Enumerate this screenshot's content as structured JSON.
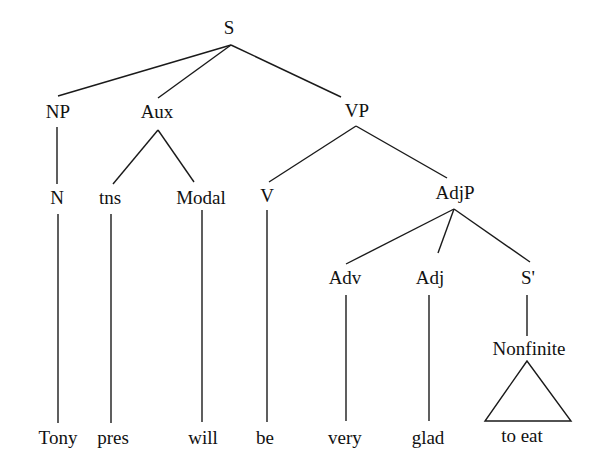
{
  "diagram": {
    "type": "syntax-tree",
    "colors": {
      "line": "#1a1a1a",
      "text": "#111111",
      "background": "#ffffff"
    },
    "nodes": [
      {
        "id": "S",
        "label": "S",
        "x": 229,
        "y": 30
      },
      {
        "id": "NP",
        "label": "NP",
        "x": 58,
        "y": 114
      },
      {
        "id": "Aux",
        "label": "Aux",
        "x": 157,
        "y": 114
      },
      {
        "id": "VP",
        "label": "VP",
        "x": 357,
        "y": 113
      },
      {
        "id": "N",
        "label": "N",
        "x": 57,
        "y": 200
      },
      {
        "id": "tns",
        "label": "tns",
        "x": 110,
        "y": 200
      },
      {
        "id": "Modal",
        "label": "Modal",
        "x": 201,
        "y": 200
      },
      {
        "id": "V",
        "label": "V",
        "x": 267,
        "y": 198
      },
      {
        "id": "AdjP",
        "label": "AdjP",
        "x": 455,
        "y": 195
      },
      {
        "id": "Adv",
        "label": "Adv",
        "x": 345,
        "y": 280
      },
      {
        "id": "Adj",
        "label": "Adj",
        "x": 430,
        "y": 280
      },
      {
        "id": "Sbar",
        "label": "S'",
        "x": 528,
        "y": 280
      },
      {
        "id": "Nonfinite",
        "label": "Nonfinite",
        "x": 529,
        "y": 351
      }
    ],
    "leaves": [
      {
        "id": "tony",
        "label": "Tony",
        "x": 58,
        "y": 440
      },
      {
        "id": "pres",
        "label": "pres",
        "x": 113,
        "y": 440
      },
      {
        "id": "will",
        "label": "will",
        "x": 203,
        "y": 440
      },
      {
        "id": "be",
        "label": "be",
        "x": 265,
        "y": 440
      },
      {
        "id": "very",
        "label": "very",
        "x": 345,
        "y": 440
      },
      {
        "id": "glad",
        "label": "glad",
        "x": 428,
        "y": 440
      },
      {
        "id": "to-eat",
        "label": "to eat",
        "x": 522,
        "y": 438
      }
    ],
    "edges": [
      {
        "from": "S",
        "to": "NP"
      },
      {
        "from": "S",
        "to": "Aux"
      },
      {
        "from": "S",
        "to": "VP"
      },
      {
        "from": "NP",
        "to": "N"
      },
      {
        "from": "Aux",
        "to": "tns"
      },
      {
        "from": "Aux",
        "to": "Modal"
      },
      {
        "from": "VP",
        "to": "V"
      },
      {
        "from": "VP",
        "to": "AdjP"
      },
      {
        "from": "AdjP",
        "to": "Adv"
      },
      {
        "from": "AdjP",
        "to": "Adj"
      },
      {
        "from": "AdjP",
        "to": "Sbar"
      },
      {
        "from": "Sbar",
        "to": "Nonfinite"
      },
      {
        "from": "N",
        "to": "tony"
      },
      {
        "from": "tns",
        "to": "pres"
      },
      {
        "from": "Modal",
        "to": "will"
      },
      {
        "from": "V",
        "to": "be"
      },
      {
        "from": "Adv",
        "to": "very"
      },
      {
        "from": "Adj",
        "to": "glad"
      }
    ],
    "triangles": [
      {
        "from": "Nonfinite",
        "to": "to-eat"
      }
    ]
  }
}
